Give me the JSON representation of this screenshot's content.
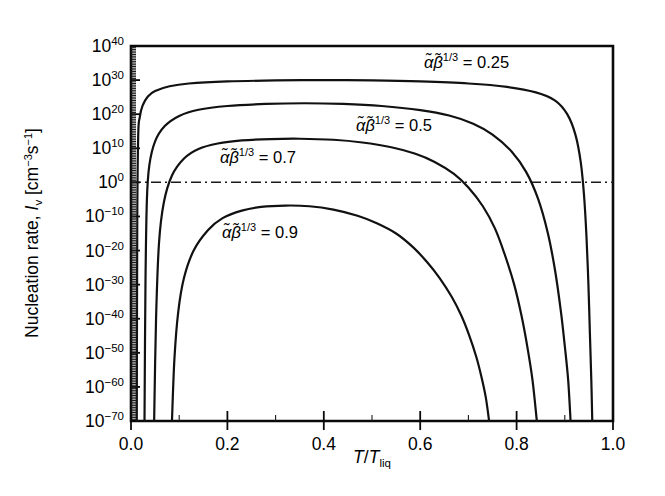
{
  "chart_data": {
    "type": "line",
    "title": "",
    "xlabel": "T/Tliq",
    "ylabel": "Nucleation rate, Iv [cm-3s-1]",
    "xlim": [
      0.0,
      1.0
    ],
    "ylim_log10": [
      -70,
      40
    ],
    "grid": false,
    "legend_position": "inline-annotations",
    "x_ticks": [
      "0.0",
      "0.2",
      "0.4",
      "0.6",
      "0.8",
      "1.0"
    ],
    "x_tick_values": [
      0.0,
      0.2,
      0.4,
      0.6,
      0.8,
      1.0
    ],
    "y_ticks": [
      "10^40",
      "10^30",
      "10^20",
      "10^10",
      "10^0",
      "10^-10",
      "10^-20",
      "10^-30",
      "10^-40",
      "10^-50",
      "10^-60",
      "10^-70"
    ],
    "y_tick_exponents": [
      40,
      30,
      20,
      10,
      0,
      -10,
      -20,
      -30,
      -40,
      -50,
      -60,
      -70
    ],
    "reference_line": {
      "label": "Iv = 1 cm-3s-1",
      "y_log10": 0,
      "style": "dash-dot"
    },
    "series": [
      {
        "name": "alpha_beta_0.25",
        "label_text": "= 0.25",
        "points_xy_log10": [
          [
            0.012,
            -70
          ],
          [
            0.013,
            -10
          ],
          [
            0.015,
            14
          ],
          [
            0.018,
            19
          ],
          [
            0.024,
            22.5
          ],
          [
            0.035,
            25.2
          ],
          [
            0.05,
            26.8
          ],
          [
            0.08,
            28.2
          ],
          [
            0.12,
            29.0
          ],
          [
            0.2,
            29.6
          ],
          [
            0.3,
            29.9
          ],
          [
            0.4,
            30.0
          ],
          [
            0.5,
            29.9
          ],
          [
            0.6,
            29.6
          ],
          [
            0.7,
            29.0
          ],
          [
            0.78,
            28.0
          ],
          [
            0.84,
            26.4
          ],
          [
            0.88,
            24.0
          ],
          [
            0.905,
            20.0
          ],
          [
            0.922,
            14.0
          ],
          [
            0.933,
            6.0
          ],
          [
            0.94,
            -4.0
          ],
          [
            0.945,
            -16.0
          ],
          [
            0.949,
            -30.0
          ],
          [
            0.952,
            -44.0
          ],
          [
            0.955,
            -58.0
          ],
          [
            0.957,
            -70
          ]
        ]
      },
      {
        "name": "alpha_beta_0.5",
        "label_text": "= 0.5",
        "points_xy_log10": [
          [
            0.028,
            -70
          ],
          [
            0.03,
            -30
          ],
          [
            0.033,
            -5
          ],
          [
            0.038,
            5
          ],
          [
            0.05,
            12
          ],
          [
            0.07,
            16.5
          ],
          [
            0.1,
            19.5
          ],
          [
            0.14,
            21.3
          ],
          [
            0.2,
            22.4
          ],
          [
            0.28,
            23.0
          ],
          [
            0.36,
            23.2
          ],
          [
            0.44,
            23.0
          ],
          [
            0.52,
            22.4
          ],
          [
            0.6,
            21.2
          ],
          [
            0.66,
            19.6
          ],
          [
            0.71,
            17.2
          ],
          [
            0.75,
            14.0
          ],
          [
            0.79,
            9.0
          ],
          [
            0.82,
            3.0
          ],
          [
            0.845,
            -5.0
          ],
          [
            0.865,
            -15.0
          ],
          [
            0.88,
            -26.0
          ],
          [
            0.892,
            -38.0
          ],
          [
            0.9,
            -48.0
          ],
          [
            0.907,
            -58.0
          ],
          [
            0.912,
            -70
          ]
        ]
      },
      {
        "name": "alpha_beta_0.7",
        "label_text": "= 0.7",
        "points_xy_log10": [
          [
            0.048,
            -70
          ],
          [
            0.052,
            -40
          ],
          [
            0.058,
            -18
          ],
          [
            0.068,
            -6
          ],
          [
            0.085,
            2
          ],
          [
            0.11,
            7
          ],
          [
            0.14,
            9.8
          ],
          [
            0.18,
            11.4
          ],
          [
            0.23,
            12.3
          ],
          [
            0.29,
            12.7
          ],
          [
            0.35,
            12.8
          ],
          [
            0.42,
            12.5
          ],
          [
            0.48,
            11.7
          ],
          [
            0.54,
            10.3
          ],
          [
            0.59,
            8.4
          ],
          [
            0.63,
            6.0
          ],
          [
            0.67,
            2.5
          ],
          [
            0.7,
            -1.5
          ],
          [
            0.73,
            -7.0
          ],
          [
            0.755,
            -13.5
          ],
          [
            0.775,
            -21.0
          ],
          [
            0.795,
            -30.0
          ],
          [
            0.81,
            -39.0
          ],
          [
            0.822,
            -48.0
          ],
          [
            0.833,
            -58.0
          ],
          [
            0.842,
            -70
          ]
        ]
      },
      {
        "name": "alpha_beta_0.9",
        "label_text": "= 0.9",
        "points_xy_log10": [
          [
            0.085,
            -70
          ],
          [
            0.09,
            -52
          ],
          [
            0.098,
            -38
          ],
          [
            0.11,
            -28
          ],
          [
            0.13,
            -20
          ],
          [
            0.16,
            -14
          ],
          [
            0.19,
            -10.5
          ],
          [
            0.23,
            -8.3
          ],
          [
            0.27,
            -7.2
          ],
          [
            0.32,
            -6.8
          ],
          [
            0.37,
            -7.0
          ],
          [
            0.42,
            -8.0
          ],
          [
            0.47,
            -9.8
          ],
          [
            0.51,
            -12.0
          ],
          [
            0.55,
            -15.0
          ],
          [
            0.585,
            -19.0
          ],
          [
            0.615,
            -23.5
          ],
          [
            0.64,
            -28.0
          ],
          [
            0.665,
            -33.5
          ],
          [
            0.685,
            -39.0
          ],
          [
            0.702,
            -45.0
          ],
          [
            0.716,
            -51.0
          ],
          [
            0.727,
            -57.0
          ],
          [
            0.736,
            -63.0
          ],
          [
            0.743,
            -70
          ]
        ]
      }
    ],
    "annotations": [
      {
        "id": "ann-025",
        "symbol": "alpha-beta-tilde",
        "exponent": "1/3",
        "equals": "=",
        "value": "0.25",
        "x_px": 424,
        "y_px": 68
      },
      {
        "id": "ann-05",
        "symbol": "alpha-beta-tilde",
        "exponent": "1/3",
        "equals": "=",
        "value": "0.5",
        "x_px": 356,
        "y_px": 131
      },
      {
        "id": "ann-07",
        "symbol": "alpha-beta-tilde",
        "exponent": "1/3",
        "equals": "=",
        "value": "0.7",
        "x_px": 220,
        "y_px": 163
      },
      {
        "id": "ann-09",
        "symbol": "alpha-beta-tilde",
        "exponent": "1/3",
        "equals": "=",
        "value": "0.9",
        "x_px": 222,
        "y_px": 238
      }
    ]
  },
  "axes": {
    "y_title_parts": {
      "main": "Nucleation rate, ",
      "symbol": "I",
      "subscript": "v",
      "units_open": " [cm",
      "units_exp1": "−3",
      "units_mid": "s",
      "units_exp2": "−1",
      "units_close": "]"
    },
    "x_title_parts": {
      "numerator": "T",
      "slash": "/",
      "denominator": "T",
      "subscript": "liq"
    },
    "y_labels": [
      {
        "mantissa": "10",
        "exponent": "40"
      },
      {
        "mantissa": "10",
        "exponent": "30"
      },
      {
        "mantissa": "10",
        "exponent": "20"
      },
      {
        "mantissa": "10",
        "exponent": "10"
      },
      {
        "mantissa": "10",
        "exponent": "0"
      },
      {
        "mantissa": "10",
        "exponent": "−10"
      },
      {
        "mantissa": "10",
        "exponent": "−20"
      },
      {
        "mantissa": "10",
        "exponent": "−30"
      },
      {
        "mantissa": "10",
        "exponent": "−40"
      },
      {
        "mantissa": "10",
        "exponent": "−50"
      },
      {
        "mantissa": "10",
        "exponent": "−60"
      },
      {
        "mantissa": "10",
        "exponent": "−70"
      }
    ],
    "x_labels": [
      "0.0",
      "0.2",
      "0.4",
      "0.6",
      "0.8",
      "1.0"
    ]
  },
  "colors": {
    "curve": "#111111",
    "axis": "#0a0a0a",
    "background": "#ffffff",
    "reference": "#1a1a1a"
  }
}
